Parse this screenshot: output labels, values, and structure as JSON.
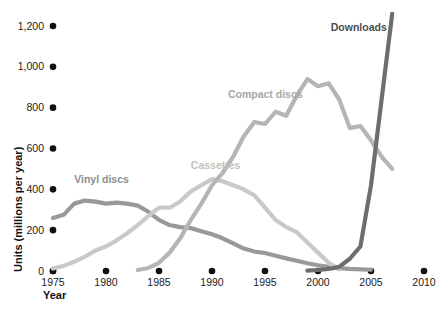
{
  "chart_data": {
    "type": "line",
    "title": "",
    "xlabel": "Year",
    "ylabel": "Units (millions per year)",
    "xlim": [
      1975,
      2010
    ],
    "ylim": [
      0,
      1200
    ],
    "grid": false,
    "legend_position": "inline-labels",
    "x_ticks": [
      "1975",
      "1980",
      "1985",
      "1990",
      "1995",
      "2000",
      "2005",
      "2010"
    ],
    "x_tick_values": [
      1975,
      1980,
      1985,
      1990,
      1995,
      2000,
      2005,
      2010
    ],
    "y_ticks": [
      "0",
      "200",
      "400",
      "600",
      "800",
      "1,000",
      "1,200"
    ],
    "y_tick_values": [
      0,
      200,
      400,
      600,
      800,
      1000,
      1200
    ],
    "series": [
      {
        "name": "Vinyl discs",
        "color": "#999999",
        "label_color": "#8d8d8d",
        "label_x": 1977.0,
        "label_y": 430,
        "x": [
          1975,
          1976,
          1977,
          1978,
          1979,
          1980,
          1981,
          1982,
          1983,
          1984,
          1985,
          1986,
          1987,
          1988,
          1989,
          1990,
          1991,
          1992,
          1993,
          1994,
          1995,
          1996,
          1997,
          1998,
          1999,
          2000,
          2001,
          2002,
          2003,
          2004,
          2005
        ],
        "values": [
          260,
          275,
          330,
          345,
          340,
          330,
          335,
          330,
          320,
          290,
          250,
          225,
          215,
          210,
          195,
          180,
          160,
          135,
          110,
          95,
          88,
          75,
          62,
          50,
          38,
          28,
          20,
          14,
          10,
          8,
          6
        ]
      },
      {
        "name": "Cassettes",
        "color": "#c9c9c9",
        "label_color": "#c2c2c2",
        "label_x": 1988.0,
        "label_y": 500,
        "x": [
          1975,
          1976,
          1977,
          1978,
          1979,
          1980,
          1981,
          1982,
          1983,
          1984,
          1985,
          1986,
          1987,
          1988,
          1989,
          1990,
          1991,
          1992,
          1993,
          1994,
          1995,
          1996,
          1997,
          1998,
          1999,
          2000,
          2001,
          2002
        ],
        "values": [
          12,
          25,
          45,
          70,
          100,
          120,
          150,
          185,
          225,
          270,
          310,
          310,
          340,
          390,
          420,
          450,
          440,
          420,
          400,
          370,
          310,
          250,
          215,
          190,
          140,
          90,
          40,
          8
        ]
      },
      {
        "name": "Compact discs",
        "color": "#b5b5b5",
        "label_color": "#a8a8a8",
        "label_x": 1991.5,
        "label_y": 845,
        "x": [
          1983,
          1984,
          1985,
          1986,
          1987,
          1988,
          1989,
          1990,
          1991,
          1992,
          1993,
          1994,
          1995,
          1996,
          1997,
          1998,
          1999,
          2000,
          2001,
          2002,
          2003,
          2004,
          2005,
          2006,
          2007
        ],
        "values": [
          5,
          15,
          40,
          90,
          160,
          250,
          330,
          420,
          480,
          560,
          660,
          730,
          720,
          780,
          760,
          860,
          940,
          905,
          920,
          840,
          700,
          710,
          640,
          560,
          500
        ]
      },
      {
        "name": "Downloads",
        "color": "#6e6e6e",
        "label_color": "#4d4d4d",
        "label_x": 2001.2,
        "label_y": 1175,
        "x": [
          1999,
          2000,
          2001,
          2002,
          2003,
          2004,
          2005,
          2006,
          2007
        ],
        "values": [
          2,
          5,
          10,
          20,
          60,
          120,
          420,
          840,
          1260
        ]
      }
    ]
  }
}
